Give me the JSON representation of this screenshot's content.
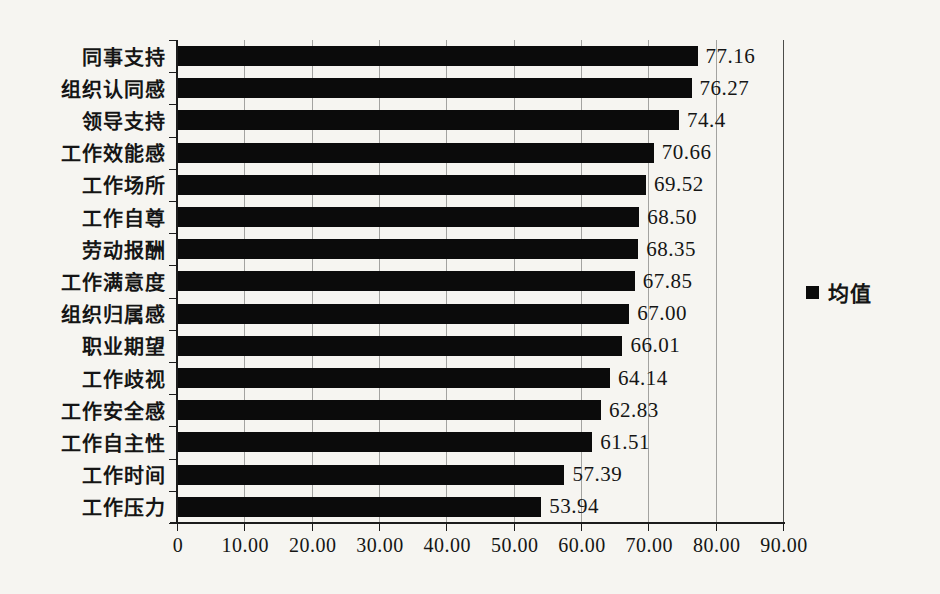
{
  "chart_data": {
    "type": "bar",
    "orientation": "horizontal",
    "title": "",
    "xlabel": "",
    "ylabel": "",
    "categories": [
      "同事支持",
      "组织认同感",
      "领导支持",
      "工作效能感",
      "工作场所",
      "工作自尊",
      "劳动报酬",
      "工作满意度",
      "组织归属感",
      "职业期望",
      "工作歧视",
      "工作安全感",
      "工作自主性",
      "工作时间",
      "工作压力"
    ],
    "values": [
      77.16,
      76.27,
      74.4,
      70.66,
      69.52,
      68.5,
      68.35,
      67.85,
      67.0,
      66.01,
      64.14,
      62.83,
      61.51,
      57.39,
      53.94
    ],
    "value_labels": [
      "77.16",
      "76.27",
      "74.4",
      "70.66",
      "69.52",
      "68.50",
      "68.35",
      "67.85",
      "67.00",
      "66.01",
      "64.14",
      "62.83",
      "61.51",
      "57.39",
      "53.94"
    ],
    "series": [
      {
        "name": "均值",
        "values": [
          77.16,
          76.27,
          74.4,
          70.66,
          69.52,
          68.5,
          68.35,
          67.85,
          67.0,
          66.01,
          64.14,
          62.83,
          61.51,
          57.39,
          53.94
        ]
      }
    ],
    "xlim": [
      0,
      90
    ],
    "x_ticks": [
      "0",
      "10.00",
      "20.00",
      "30.00",
      "40.00",
      "50.00",
      "60.00",
      "70.00",
      "80.00",
      "90.00"
    ],
    "x_tick_values": [
      0,
      10,
      20,
      30,
      40,
      50,
      60,
      70,
      80,
      90
    ],
    "grid": "vertical-major-on",
    "legend": {
      "label": "均值",
      "position": "right"
    },
    "colors": {
      "bar": "#0b0b0b",
      "gridline": "#a3a3a0",
      "axis": "#1c1c1c",
      "background": "#f6f5f1"
    }
  }
}
